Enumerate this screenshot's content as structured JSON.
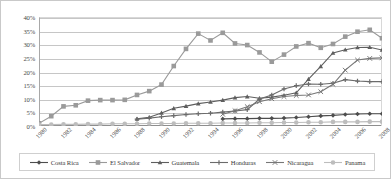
{
  "chart_data": {
    "type": "line",
    "title": "",
    "xlabel": "",
    "ylabel": "",
    "ylim": [
      0,
      40
    ],
    "yticks": [
      0,
      5,
      10,
      15,
      20,
      25,
      30,
      35,
      40
    ],
    "ytick_labels": [
      "0%",
      "5%",
      "10%",
      "15%",
      "20%",
      "25%",
      "30%",
      "35%",
      "40%"
    ],
    "grid": "horizontal",
    "legend_position": "bottom",
    "value_unit": "percent",
    "x": [
      1980,
      1981,
      1982,
      1983,
      1984,
      1985,
      1986,
      1987,
      1988,
      1989,
      1990,
      1991,
      1992,
      1993,
      1994,
      1995,
      1996,
      1997,
      1998,
      1999,
      2000,
      2001,
      2002,
      2003,
      2004,
      2005,
      2006,
      2007,
      2008
    ],
    "xtick_labels": [
      "1980",
      "1982",
      "1984",
      "1986",
      "1988",
      "1990",
      "1992",
      "1994",
      "1996",
      "1998",
      "2000",
      "2002",
      "2004",
      "2006",
      "2008"
    ],
    "xticks": [
      1980,
      1982,
      1984,
      1986,
      1988,
      1990,
      1992,
      1994,
      1996,
      1998,
      2000,
      2002,
      2004,
      2006,
      2008
    ],
    "series": [
      {
        "name": "Costa Rica",
        "marker": "diamond",
        "color": "#4d4d4d",
        "values": [
          null,
          null,
          null,
          null,
          null,
          null,
          null,
          null,
          null,
          null,
          null,
          null,
          null,
          null,
          null,
          2.6,
          2.7,
          2.7,
          2.8,
          2.8,
          2.9,
          3.1,
          3.4,
          3.7,
          3.9,
          4.2,
          4.4,
          4.5,
          4.5
        ]
      },
      {
        "name": "El Salvador",
        "marker": "square",
        "color": "#9a9a9a",
        "values": [
          1.0,
          3.6,
          7.2,
          7.6,
          9.3,
          9.5,
          9.5,
          9.6,
          11.4,
          12.8,
          15.2,
          22.0,
          28.3,
          33.9,
          31.4,
          34.2,
          30.3,
          29.7,
          27.0,
          23.6,
          26.2,
          29.2,
          30.4,
          28.7,
          30.1,
          32.8,
          34.6,
          35.3,
          32.2
        ]
      },
      {
        "name": "Guatemala",
        "marker": "triangle",
        "color": "#5e5e5e",
        "values": [
          null,
          null,
          null,
          null,
          null,
          null,
          null,
          null,
          2.6,
          3.2,
          4.8,
          6.5,
          7.3,
          8.2,
          8.8,
          9.5,
          10.4,
          10.8,
          10.2,
          10.6,
          11.3,
          12.2,
          17.2,
          21.9,
          26.8,
          28.0,
          28.8,
          28.9,
          27.9
        ]
      },
      {
        "name": "Honduras",
        "marker": "plus",
        "color": "#6b6b6b",
        "values": [
          null,
          null,
          null,
          null,
          null,
          null,
          null,
          null,
          2.5,
          2.9,
          3.4,
          3.8,
          4.2,
          4.5,
          4.7,
          5.1,
          5.5,
          6.0,
          9.9,
          11.4,
          13.6,
          14.8,
          15.4,
          15.3,
          15.7,
          17.0,
          16.5,
          16.3,
          16.3
        ]
      },
      {
        "name": "Nicaragua",
        "marker": "cross",
        "color": "#777777",
        "values": [
          null,
          null,
          null,
          null,
          null,
          null,
          null,
          null,
          null,
          null,
          null,
          null,
          null,
          null,
          null,
          4.3,
          5.6,
          7.1,
          8.9,
          10.0,
          10.8,
          11.2,
          11.4,
          12.6,
          15.3,
          20.5,
          24.2,
          24.8,
          25.0
        ]
      },
      {
        "name": "Panama",
        "marker": "circle",
        "color": "#bdbdbd",
        "values": [
          0.5,
          0.5,
          0.6,
          0.6,
          0.7,
          0.7,
          0.8,
          0.8,
          0.8,
          0.9,
          0.9,
          0.9,
          1.0,
          1.0,
          1.0,
          1.1,
          1.1,
          1.1,
          1.2,
          1.2,
          1.3,
          1.3,
          1.4,
          1.4,
          1.5,
          1.5,
          1.5,
          1.6,
          1.6
        ]
      }
    ]
  }
}
